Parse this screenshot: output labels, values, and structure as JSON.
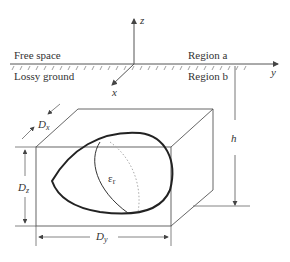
{
  "regions": {
    "upper_left": "Free space",
    "lower_left": "Lossy ground",
    "upper_right": "Region a",
    "lower_right": "Region b"
  },
  "axes": {
    "z": "z",
    "y": "y",
    "x": "x"
  },
  "dimensions": {
    "dx": "D",
    "dx_sub": "x",
    "dy": "D",
    "dy_sub": "y",
    "dz": "D",
    "dz_sub": "z",
    "h": "h"
  },
  "object": {
    "permittivity": "ε",
    "permittivity_sub": "r"
  },
  "colors": {
    "line": "#555555",
    "object": "#222222",
    "dotted": "#999999"
  }
}
